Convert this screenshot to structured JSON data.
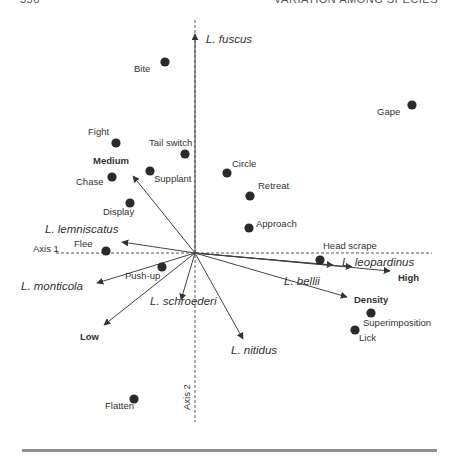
{
  "header": {
    "page_number": "556",
    "running_head": "VARIATION AMONG SPECIES"
  },
  "chart_data": {
    "type": "scatter",
    "subtype": "ordination biplot",
    "title": "",
    "xlabel": "Axis 1",
    "ylabel": "Axis 2",
    "grid": false,
    "axes_style": "dashed lines through origin",
    "origin_px": [
      195,
      253
    ],
    "points": [
      {
        "label": "Bite",
        "x": 165,
        "y": 62,
        "lx": 134,
        "ly": 72
      },
      {
        "label": "Gape",
        "x": 412,
        "y": 105,
        "lx": 377,
        "ly": 115
      },
      {
        "label": "Fight",
        "x": 116,
        "y": 143,
        "lx": 88,
        "ly": 135
      },
      {
        "label": "Tail switch",
        "x": 185,
        "y": 154,
        "lx": 149,
        "ly": 146
      },
      {
        "label": "Chase",
        "x": 112,
        "y": 177,
        "lx": 76,
        "ly": 185
      },
      {
        "label": "Supplant",
        "x": 150,
        "y": 171,
        "lx": 154,
        "ly": 182
      },
      {
        "label": "Circle",
        "x": 227,
        "y": 173,
        "lx": 232,
        "ly": 167
      },
      {
        "label": "Retreat",
        "x": 250,
        "y": 196,
        "lx": 258,
        "ly": 189
      },
      {
        "label": "Display",
        "x": 130,
        "y": 203,
        "lx": 103,
        "ly": 215
      },
      {
        "label": "Approach",
        "x": 249,
        "y": 228,
        "lx": 256,
        "ly": 227
      },
      {
        "label": "Flee",
        "x": 106,
        "y": 251,
        "lx": 74,
        "ly": 247
      },
      {
        "label": "Head scrape",
        "x": 320,
        "y": 260,
        "lx": 323,
        "ly": 249
      },
      {
        "label": "Push-up",
        "x": 162,
        "y": 267,
        "lx": 125,
        "ly": 279
      },
      {
        "label": "Superimposition",
        "x": 371,
        "y": 313,
        "lx": 363,
        "ly": 326
      },
      {
        "label": "Lick",
        "x": 355,
        "y": 330,
        "lx": 359,
        "ly": 341
      },
      {
        "label": "Flatten",
        "x": 134,
        "y": 399,
        "lx": 105,
        "ly": 409
      }
    ],
    "vectors": [
      {
        "label": "L. fuscus",
        "kind": "species",
        "x2": 195,
        "y2": 34,
        "lx": 206,
        "ly": 43
      },
      {
        "label": "Medium",
        "kind": "category",
        "x2": 133,
        "y2": 176,
        "lx": 93,
        "ly": 164
      },
      {
        "label": "L. lemniscatus",
        "kind": "species",
        "x2": 122,
        "y2": 242,
        "lx": 45,
        "ly": 233
      },
      {
        "label": "L. monticola",
        "kind": "species",
        "x2": 97,
        "y2": 283,
        "lx": 21,
        "ly": 290
      },
      {
        "label": "Low",
        "kind": "category",
        "x2": 104,
        "y2": 325,
        "lx": 80,
        "ly": 340
      },
      {
        "label": "L. schroederi",
        "kind": "species",
        "x2": 181,
        "y2": 300,
        "lx": 150,
        "ly": 305
      },
      {
        "label": "L. nitidus",
        "kind": "species",
        "x2": 243,
        "y2": 339,
        "lx": 231,
        "ly": 354
      },
      {
        "label": "L. bellii",
        "kind": "species",
        "x2": 333,
        "y2": 265,
        "lx": 284,
        "ly": 285
      },
      {
        "label": "L. leopardinus",
        "kind": "species",
        "x2": 352,
        "y2": 267,
        "lx": 342,
        "ly": 266
      },
      {
        "label": "High",
        "kind": "category",
        "x2": 390,
        "y2": 271,
        "lx": 398,
        "ly": 281
      },
      {
        "label": "Density",
        "kind": "variable",
        "x2": 347,
        "y2": 297,
        "lx": 354,
        "ly": 303
      }
    ],
    "axis_labels": [
      {
        "text": "Axis 1",
        "x": 33,
        "y": 252
      },
      {
        "text": "Axis 2",
        "x": 190,
        "y": 410,
        "rotate": -90
      }
    ]
  },
  "colors": {
    "ink": "#333333",
    "axis": "#555555",
    "rule": "#8e8e8e"
  }
}
